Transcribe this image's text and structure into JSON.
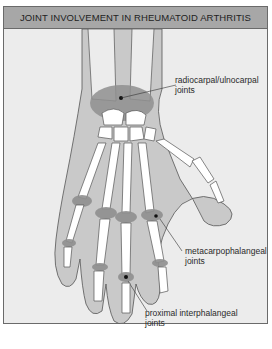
{
  "title": "JOINT INVOLVEMENT IN RHEUMATOID ARTHRITIS",
  "labels": {
    "wrist": {
      "line1": "radiocarpal/ulnocarpal",
      "line2": "joints"
    },
    "mcp": {
      "line1": "metacarpophalangeal",
      "line2": "joints"
    },
    "pip": {
      "line1": "proximal interphalangeal",
      "line2": "joints"
    }
  },
  "colors": {
    "background": "#ececec",
    "header": "#a7a7a7",
    "skin": "#c9c9c9",
    "bone": "#ffffff",
    "inflamed": "#8f8f8f",
    "outline": "#555555"
  }
}
